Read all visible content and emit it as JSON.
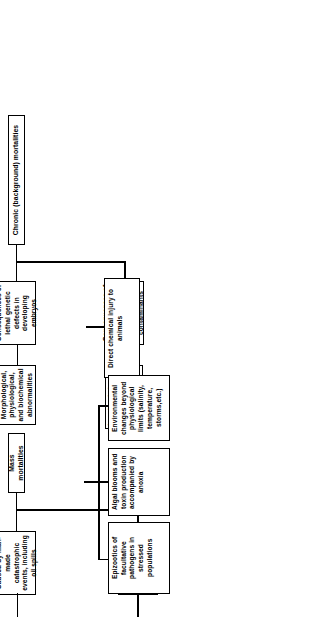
{
  "figure": {
    "type": "hierarchy-tree",
    "orientation": "rotated-90-ccw",
    "title_present": false,
    "branches": [
      {
        "id": "chronic",
        "root": "Chronic (background) mortalities",
        "children": [
          {
            "id": "genetic-defects",
            "label": "Consequences of lethal genetic defects in developing embryos",
            "children": [
              {
                "id": "abnormalities",
                "label": "Morphological, physiological, and biochemical abnormalities"
              }
            ]
          },
          {
            "id": "long-term-stress",
            "label": "Consequences of long-term stress from environmental contaminants",
            "children": [
              {
                "id": "chronic-disease",
                "label": "Low-level chronic disease caused by facultative pathogens"
              }
            ]
          }
        ]
      },
      {
        "id": "mass",
        "root": "Mass mortalities",
        "children": [
          {
            "id": "man-made",
            "label": "Caused by man-made catastrophic events, including oil spills",
            "children": [
              {
                "id": "chemical-injury",
                "label": "Direct chemical injury to animals"
              }
            ]
          },
          {
            "id": "natural",
            "label": "Caused by natural phenomena",
            "children": [
              {
                "id": "env-changes",
                "label": "Environmental changes beyond physiological limits (salinity, temperature, storms,etc.)"
              },
              {
                "id": "algal-blooms",
                "label": "Algal blooms and toxin production accompanied by anoxia"
              },
              {
                "id": "epizootics",
                "label": "Epizootics of facultative pathogens in stressed populations"
              }
            ]
          }
        ]
      }
    ],
    "nodes": {
      "chronic_root": "Chronic (background) mortalities",
      "genetic_defects": "Consequences of lethal genetic defects in developing embryos",
      "abnormalities": "Morphological, physiological, and biochemical abnormalities",
      "long_term_stress": "Consequences of long-term stress from environmental contaminants",
      "chronic_disease": "Low-level chronic disease caused by facultative pathogens",
      "mass_root": "Mass mortalities",
      "man_made": "Caused by man-made catastrophic events, including oil spills",
      "chemical_injury": "Direct chemical injury to animals",
      "natural": "Caused by natural phenomena",
      "env_changes": "Environmental changes beyond physiological limits (salinity, temperature, storms,etc.)",
      "algal_blooms": "Algal blooms and toxin production accompanied by anoxia",
      "epizootics": "Epizootics of facultative pathogens in stressed populations"
    },
    "colors": {
      "stroke": "#000000",
      "fill": "#ffffff",
      "text": "#000000"
    }
  }
}
